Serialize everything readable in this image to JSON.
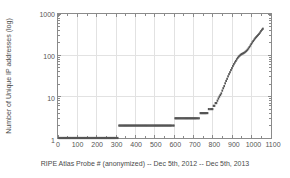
{
  "chart_data": {
    "type": "scatter",
    "title": "",
    "xlabel": "RIPE Atlas Probe # (anonymized) -- Dec 5th, 2012 -- Dec 5th, 2013",
    "ylabel": "Number of Unique IP addresses (log)",
    "xlim": [
      0,
      1100
    ],
    "ylim": [
      1,
      1000
    ],
    "yscale": "log",
    "xscale": "linear",
    "grid": true,
    "legend": null,
    "marker": "square",
    "marker_color": "#555555",
    "xticks": [
      0,
      100,
      200,
      300,
      400,
      500,
      600,
      700,
      800,
      900,
      1000,
      1100
    ],
    "xtick_labels": [
      "0",
      "100",
      "200",
      "300",
      "400",
      "500",
      "600",
      "700",
      "800",
      "900",
      "1000",
      "1100"
    ],
    "yticks": [
      1,
      10,
      100,
      1000
    ],
    "ytick_labels": [
      "1",
      "10",
      "100",
      "1000"
    ],
    "series": [
      {
        "name": "Unique IP addresses per probe",
        "x": [
          5,
          20,
          40,
          60,
          80,
          100,
          120,
          140,
          160,
          180,
          200,
          220,
          240,
          260,
          280,
          295,
          308,
          315,
          330,
          350,
          370,
          390,
          410,
          430,
          450,
          470,
          490,
          510,
          530,
          550,
          570,
          585,
          598,
          605,
          620,
          640,
          660,
          680,
          700,
          715,
          728,
          735,
          745,
          755,
          765,
          772,
          778,
          785,
          792,
          798,
          803,
          808,
          813,
          818,
          823,
          828,
          833,
          838,
          843,
          848,
          853,
          858,
          863,
          868,
          873,
          878,
          883,
          888,
          893,
          898,
          903,
          908,
          913,
          918,
          923,
          928,
          933,
          938,
          943,
          948,
          953,
          958,
          963,
          968,
          973,
          978,
          983,
          988,
          993,
          998,
          1003,
          1008,
          1013,
          1018,
          1023,
          1028,
          1033,
          1038,
          1043,
          1048,
          1053,
          1058
        ],
        "y": [
          1,
          1,
          1,
          1,
          1,
          1,
          1,
          1,
          1,
          1,
          1,
          1,
          1,
          1,
          1,
          1,
          1,
          2,
          2,
          2,
          2,
          2,
          2,
          2,
          2,
          2,
          2,
          2,
          2,
          2,
          2,
          2,
          2,
          3,
          3,
          3,
          3,
          3,
          3,
          3,
          3,
          4,
          4,
          4,
          4,
          4,
          5,
          5,
          5,
          5,
          6,
          6,
          7,
          7,
          8,
          9,
          10,
          11,
          12,
          14,
          16,
          18,
          21,
          24,
          27,
          31,
          35,
          39,
          44,
          49,
          55,
          61,
          67,
          73,
          80,
          87,
          93,
          98,
          103,
          107,
          110,
          113,
          117,
          122,
          128,
          136,
          146,
          158,
          172,
          188,
          205,
          222,
          240,
          258,
          275,
          292,
          310,
          330,
          355,
          385,
          415,
          440
        ]
      }
    ]
  },
  "axes": {
    "y_title": "Number of Unique IP addresses (log)",
    "x_title": "RIPE Atlas Probe # (anonymized) -- Dec 5th, 2012 -- Dec 5th, 2013"
  },
  "style": {
    "marker_color": "#555555",
    "axis_color": "#8a8a8a",
    "grid_color": "#e2e2e2",
    "text_color": "#4a4a4a",
    "background": "#ffffff"
  }
}
